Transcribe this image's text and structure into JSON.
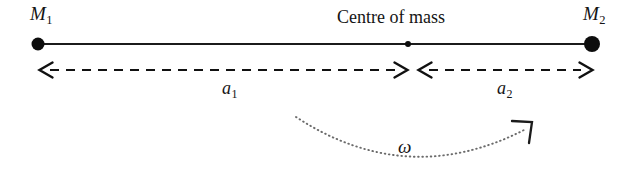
{
  "figure": {
    "background_color": "#ffffff",
    "ink_color": "#141414",
    "arc_color": "#6e6e6e"
  },
  "labels": {
    "mass1": {
      "symbol": "M",
      "subscript": "1"
    },
    "mass2": {
      "symbol": "M",
      "subscript": "2"
    },
    "centre_of_mass": "Centre of mass",
    "distance1": {
      "symbol": "a",
      "subscript": "1"
    },
    "distance2": {
      "symbol": "a",
      "subscript": "2"
    },
    "angular_velocity": "ω"
  },
  "geometry": {
    "rod": {
      "x1": 38,
      "y1": 44,
      "x2": 592,
      "y2": 44
    },
    "mass1_dot": {
      "cx": 38,
      "cy": 44,
      "r": 6.5
    },
    "mass2_dot": {
      "cx": 592,
      "cy": 44,
      "r": 8.0
    },
    "com_dot": {
      "cx": 408,
      "cy": 44,
      "r": 3.0
    },
    "dimension1": {
      "x1": 40,
      "x2": 407,
      "y": 70,
      "left_arrow": true,
      "right_arrow": true
    },
    "dimension2": {
      "x1": 418,
      "x2": 592,
      "y": 70,
      "left_arrow": true,
      "right_arrow": true
    },
    "rotation_arc": {
      "start_x": 296,
      "start_y": 117,
      "bottom_y": 164,
      "end_x": 530,
      "end_y": 126
    }
  },
  "icon_names": {
    "mass1_dot": "filled-circle-marker",
    "mass2_dot": "filled-circle-marker",
    "com_dot": "small-filled-circle-marker",
    "dimension1": "double-headed-dashed-arrow",
    "dimension2": "double-headed-dashed-arrow",
    "rotation_arc": "dotted-curved-arrow"
  }
}
